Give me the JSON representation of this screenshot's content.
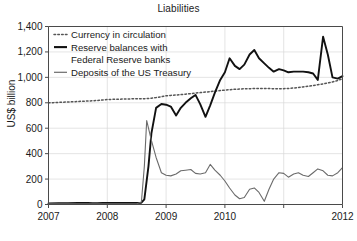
{
  "chart_data": {
    "type": "line",
    "title": "Liabilities",
    "xlabel": "",
    "ylabel": "US$ billion",
    "xlim": [
      2007,
      2012
    ],
    "ylim": [
      0,
      1400
    ],
    "yticks": [
      0,
      200,
      400,
      600,
      800,
      1000,
      1200,
      1400
    ],
    "ytick_labels": [
      "0",
      "200",
      "400",
      "600",
      "800",
      "1,000",
      "1,200",
      "1,400"
    ],
    "xticks": [
      2007,
      2008,
      2009,
      2010,
      2011,
      2012
    ],
    "xtick_labels": [
      "2007",
      "2008",
      "2009",
      "2010",
      "",
      "2012"
    ],
    "grid": true,
    "legend_position": "top-left",
    "series": [
      {
        "name": "Currency in circulation",
        "style": "dotted",
        "color": "#555555",
        "x": [
          2007.0,
          2007.08,
          2007.17,
          2007.25,
          2007.33,
          2007.42,
          2007.5,
          2007.58,
          2007.67,
          2007.75,
          2007.83,
          2007.92,
          2008.0,
          2008.08,
          2008.17,
          2008.25,
          2008.33,
          2008.42,
          2008.5,
          2008.58,
          2008.67,
          2008.75,
          2008.83,
          2008.92,
          2009.0,
          2009.08,
          2009.17,
          2009.25,
          2009.33,
          2009.42,
          2009.5,
          2009.58,
          2009.67,
          2009.75,
          2009.83,
          2009.92,
          2010.0,
          2010.08,
          2010.17,
          2010.25,
          2010.33,
          2010.42,
          2010.5,
          2010.58,
          2010.67,
          2010.75,
          2010.83,
          2010.92,
          2011.0,
          2011.08,
          2011.17,
          2011.25,
          2011.33,
          2011.42,
          2011.5,
          2011.58,
          2011.67,
          2011.75,
          2011.83,
          2011.92,
          2012.0
        ],
        "values": [
          800,
          801,
          803,
          805,
          806,
          808,
          810,
          812,
          814,
          816,
          818,
          822,
          826,
          827,
          828,
          829,
          830,
          831,
          831,
          832,
          833,
          836,
          841,
          848,
          855,
          858,
          861,
          864,
          868,
          872,
          876,
          880,
          884,
          888,
          892,
          896,
          900,
          903,
          906,
          908,
          910,
          911,
          912,
          913,
          913,
          912,
          911,
          910,
          911,
          913,
          916,
          920,
          925,
          930,
          936,
          942,
          949,
          956,
          964,
          975,
          990
        ]
      },
      {
        "name": "Reserve balances with Federal Reserve banks",
        "style": "solid-thick",
        "color": "#111111",
        "x": [
          2007.0,
          2007.17,
          2007.33,
          2007.5,
          2007.58,
          2007.67,
          2007.75,
          2007.83,
          2007.92,
          2008.0,
          2008.08,
          2008.17,
          2008.25,
          2008.33,
          2008.42,
          2008.5,
          2008.58,
          2008.63,
          2008.7,
          2008.75,
          2008.83,
          2008.92,
          2009.0,
          2009.08,
          2009.17,
          2009.25,
          2009.33,
          2009.42,
          2009.5,
          2009.58,
          2009.67,
          2009.75,
          2009.83,
          2009.92,
          2010.0,
          2010.08,
          2010.17,
          2010.25,
          2010.33,
          2010.42,
          2010.5,
          2010.58,
          2010.67,
          2010.75,
          2010.83,
          2010.92,
          2011.0,
          2011.08,
          2011.17,
          2011.25,
          2011.33,
          2011.42,
          2011.5,
          2011.58,
          2011.67,
          2011.75,
          2011.83,
          2011.92,
          2012.0
        ],
        "values": [
          8,
          10,
          10,
          12,
          12,
          12,
          11,
          11,
          12,
          12,
          12,
          12,
          12,
          12,
          12,
          12,
          14,
          40,
          300,
          560,
          760,
          790,
          785,
          770,
          700,
          760,
          800,
          835,
          862,
          790,
          690,
          780,
          880,
          980,
          1040,
          1150,
          1090,
          1065,
          1100,
          1180,
          1215,
          1150,
          1110,
          1075,
          1045,
          1065,
          1055,
          1040,
          1045,
          1045,
          1045,
          1040,
          1030,
          980,
          1320,
          1180,
          1000,
          990,
          1010
        ]
      },
      {
        "name": "Deposits of the US Treasury",
        "style": "solid-thin",
        "color": "#6b6b6b",
        "x": [
          2007.0,
          2007.25,
          2007.5,
          2007.75,
          2008.0,
          2008.25,
          2008.5,
          2008.58,
          2008.63,
          2008.67,
          2008.75,
          2008.83,
          2008.92,
          2009.0,
          2009.08,
          2009.17,
          2009.25,
          2009.33,
          2009.42,
          2009.5,
          2009.58,
          2009.67,
          2009.75,
          2009.83,
          2009.92,
          2010.0,
          2010.08,
          2010.17,
          2010.25,
          2010.33,
          2010.42,
          2010.5,
          2010.58,
          2010.67,
          2010.75,
          2010.83,
          2010.92,
          2011.0,
          2011.08,
          2011.17,
          2011.25,
          2011.33,
          2011.42,
          2011.5,
          2011.58,
          2011.67,
          2011.75,
          2011.83,
          2011.92,
          2012.0
        ],
        "values": [
          5,
          5,
          5,
          5,
          5,
          5,
          6,
          20,
          300,
          660,
          505,
          370,
          250,
          230,
          225,
          240,
          265,
          270,
          275,
          245,
          240,
          250,
          315,
          270,
          230,
          185,
          130,
          75,
          45,
          55,
          120,
          130,
          95,
          25,
          120,
          200,
          250,
          245,
          215,
          240,
          250,
          230,
          220,
          250,
          280,
          265,
          230,
          225,
          250,
          290
        ]
      }
    ]
  },
  "legend": {
    "entries": [
      {
        "label": "Currency in circulation",
        "style": "dotted"
      },
      {
        "label": "Reserve balances with",
        "style": "solid-thick"
      },
      {
        "label": "Federal Reserve banks",
        "style": "none"
      },
      {
        "label": "Deposits of the US Treasury",
        "style": "solid-thin"
      }
    ]
  }
}
